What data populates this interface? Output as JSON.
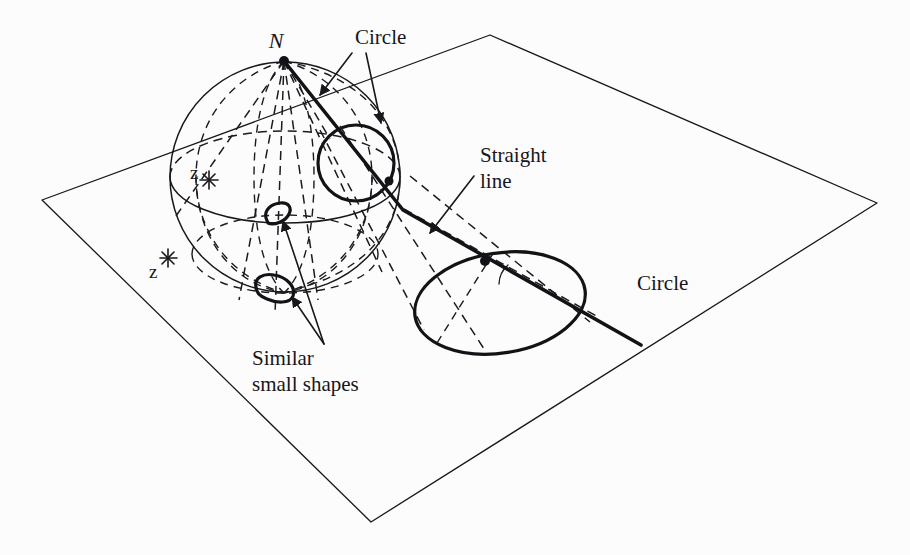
{
  "figure": {
    "background_color": "#fcfcfc",
    "ink_color": "#18171b",
    "width": 910,
    "height": 555
  },
  "labels": {
    "north_pole": "N",
    "circle_on_sphere": "Circle",
    "straight_line": "Straight\nline",
    "straight_line_line1": "Straight",
    "straight_line_line2": "line",
    "circle_on_plane": "Circle",
    "similar_shapes_line1": "Similar",
    "similar_shapes_line2": "small shapes",
    "point_z_upper": "z",
    "point_z_lower": "z"
  },
  "geometry": {
    "sphere": {
      "cx": 285,
      "cy": 177,
      "r": 115
    },
    "north_pole_point": {
      "x": 284,
      "y": 61
    },
    "circle_on_sphere": {
      "cx": 356,
      "cy": 163,
      "r": 38
    },
    "ellipse_on_plane": {
      "cx": 500,
      "cy": 303,
      "rx": 86,
      "ry": 50,
      "rotation_deg": -9
    },
    "plane_corners": [
      {
        "x": 490,
        "y": 35
      },
      {
        "x": 877,
        "y": 203
      },
      {
        "x": 371,
        "y": 522
      },
      {
        "x": 42,
        "y": 200
      }
    ],
    "tangency_point": {
      "x": 458,
      "y": 261
    },
    "line_exit_point": {
      "x": 403,
      "y": 210
    },
    "line_end_point": {
      "x": 641,
      "y": 345
    },
    "small_shape_upper": {
      "x": 277,
      "y": 212
    },
    "small_shape_lower": {
      "x": 272,
      "y": 292
    },
    "z_mark_upper": {
      "x": 209,
      "y": 180
    },
    "z_mark_lower": {
      "x": 168,
      "y": 258
    }
  },
  "annotations": [
    {
      "name": "circle-on-sphere",
      "label": "Circle",
      "text_x": 355,
      "text_y": 44
    },
    {
      "name": "straight-line",
      "label": "Straight line",
      "text_x": 480,
      "text_y": 162
    },
    {
      "name": "circle-on-plane",
      "label": "Circle",
      "text_x": 637,
      "text_y": 290
    },
    {
      "name": "similar-small-shapes",
      "label": "Similar small shapes",
      "text_x": 252,
      "text_y": 360
    }
  ]
}
